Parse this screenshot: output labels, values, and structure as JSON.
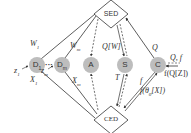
{
  "nodes": {
    "sed": {
      "label": "SED",
      "cx": 111,
      "cy": 14
    },
    "ced": {
      "label": "CED",
      "cx": 111,
      "cy": 120
    },
    "d1": {
      "label": "D",
      "sub": "1",
      "cx": 37,
      "cy": 65
    },
    "dm": {
      "label": "D",
      "sub": "m",
      "cx": 62,
      "cy": 65
    },
    "a": {
      "label": "A",
      "cx": 91,
      "cy": 65
    },
    "s": {
      "label": "S",
      "cx": 125,
      "cy": 65
    },
    "c": {
      "label": "C",
      "cx": 158,
      "cy": 65
    }
  },
  "ellipsis": "···",
  "edge_labels": {
    "w1": "W",
    "w1_sub": "1",
    "wm": "W",
    "wm_sub": "m",
    "qw": "Q[W]",
    "q": "Q",
    "qf": "Q, f",
    "fqz": "f(Q[Z])",
    "x1": "X",
    "x1_sub": "1",
    "xm": "X",
    "xm_sub": "m",
    "t": "T",
    "f": "f",
    "ftheta": "f(θ",
    "ftheta_sub": "0",
    "ftheta_tail": "[X])",
    "z1": "z",
    "z1_sub": "1",
    "zm": "z",
    "zm_sub": "m"
  },
  "colors": {
    "node_fill": "#bdbdbd",
    "line": "#333333",
    "diamond_fill": "#ffffff"
  }
}
